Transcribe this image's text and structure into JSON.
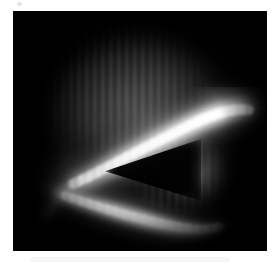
{
  "figure": {
    "background_color": "#ffffff",
    "plate_color": "#000000",
    "plate": {
      "x": 13,
      "y": 11,
      "width": 254,
      "height": 240
    },
    "canvas": {
      "width": 277,
      "height": 266
    },
    "colormap": "grayscale",
    "caption": ""
  },
  "image_content": {
    "description": "Dark field plate showing two bright curved luminous bands converging toward the left into a dark triangular wedge, with faint vertical interference fringes across the dim upper region.",
    "features": [
      {
        "name": "upper-bright-arc",
        "label": "Upper bright arc",
        "peak_gray": "#f2f2f2",
        "brightest_point": {
          "x": 207,
          "y": 108
        }
      },
      {
        "name": "lower-bright-band",
        "label": "Lower bright band",
        "peak_gray": "#e6e6e6",
        "brightest_point": {
          "x": 130,
          "y": 193
        }
      },
      {
        "name": "dark-wedge",
        "label": "Dark triangular wedge",
        "gray": "#050505"
      },
      {
        "name": "vertical-fringes",
        "label": "Vertical interference fringes",
        "gray": "#8c8c8c",
        "period_px": 8
      },
      {
        "name": "diffuse-glow-right",
        "label": "Diffuse glow (right of centre)",
        "gray": "#5c5c5c"
      },
      {
        "name": "diffuse-envelope",
        "label": "Overall illuminated envelope",
        "gray": "#4a4a4a"
      }
    ]
  },
  "palette": {
    "page_background": "#ffffff",
    "plate_background": "#000000",
    "highlight": "#ffffff",
    "band_bright": "#f2f2f2",
    "band_mid": "#b4b4b4",
    "fringe": "#8c8c8c",
    "envelope": "#4a4a4a",
    "shadow": "#000000",
    "margin_speck": "#e3e3e3"
  },
  "chart_data": {
    "type": "heatmap",
    "title": "",
    "xlabel": "",
    "ylabel": "",
    "colormap": "gray",
    "grid": false,
    "legend": "none",
    "xlim": [
      0,
      254
    ],
    "ylim": [
      0,
      240
    ],
    "annotations": [],
    "structures": [
      {
        "name": "upper-bright-arc",
        "kind": "curved-band",
        "path_points": [
          [
            52,
            178
          ],
          [
            88,
            160
          ],
          [
            122,
            140
          ],
          [
            158,
            120
          ],
          [
            192,
            103
          ],
          [
            222,
            97
          ],
          [
            240,
            100
          ]
        ],
        "thickness_px": 17,
        "peak_intensity": 0.95
      },
      {
        "name": "lower-bright-band",
        "kind": "curved-band",
        "path_points": [
          [
            40,
            182
          ],
          [
            70,
            192
          ],
          [
            104,
            203
          ],
          [
            140,
            212
          ],
          [
            172,
            218
          ],
          [
            200,
            220
          ],
          [
            214,
            217
          ]
        ],
        "thickness_px": 14,
        "peak_intensity": 0.9
      },
      {
        "name": "dark-wedge",
        "kind": "polygon",
        "vertices": [
          [
            97,
            166
          ],
          [
            190,
            130
          ],
          [
            190,
            196
          ]
        ],
        "intensity": 0.02
      },
      {
        "name": "vertical-fringes",
        "kind": "periodic-stripes",
        "orientation": "vertical",
        "period_px": 8,
        "region": [
          [
            22,
            10
          ],
          [
            228,
            216
          ]
        ],
        "intensity": 0.35
      }
    ]
  }
}
